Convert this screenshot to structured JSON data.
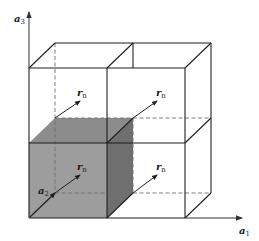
{
  "diagram": {
    "axes": {
      "vertical": {
        "base": "a",
        "sub": "3"
      },
      "horizontal": {
        "base": "a",
        "sub": "1"
      },
      "depth": {
        "base": "a",
        "sub": "2"
      }
    },
    "vector_labels": [
      {
        "id": "rn-top-left",
        "base": "r",
        "sub": "n"
      },
      {
        "id": "rn-top-right",
        "base": "r",
        "sub": "n"
      },
      {
        "id": "rn-bottom-left",
        "base": "r",
        "sub": "n"
      },
      {
        "id": "rn-bottom-right",
        "base": "r",
        "sub": "n"
      }
    ],
    "colors": {
      "line": "#1f1f1f",
      "dashed": "#6e6e6e",
      "shaded_front": "#9a9a9a",
      "shaded_top": "#8a8a8a",
      "shaded_side": "#6f6f6f",
      "axis": "#555555"
    }
  }
}
